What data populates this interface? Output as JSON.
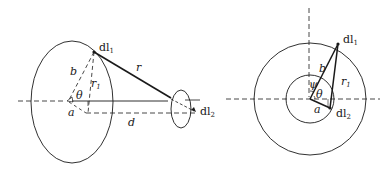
{
  "figure_left": {
    "labels": {
      "dl1": "dl",
      "dl1_sub": "1",
      "r": "r",
      "b": "b",
      "r1": "r",
      "r1_sub": "1",
      "theta": "θ",
      "a": "a",
      "d": "d",
      "dl2": "dl",
      "dl2_sub": "2"
    }
  },
  "figure_right": {
    "labels": {
      "dl1": "dl",
      "dl1_sub": "1",
      "b": "b",
      "psi": "ψ",
      "theta": "θ",
      "r1": "r",
      "r1_sub": "1",
      "a": "a",
      "dl2": "dl",
      "dl2_sub": "2"
    }
  },
  "colors": {
    "stroke": "#1a1a1a",
    "background": "#ffffff"
  }
}
